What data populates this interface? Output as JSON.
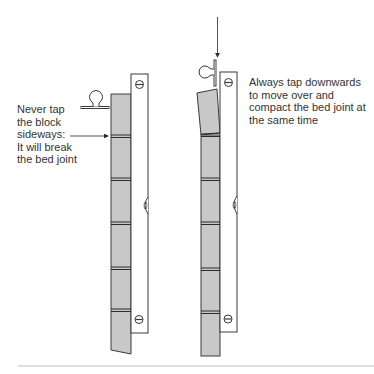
{
  "diagram": {
    "colors": {
      "background": "#ffffff",
      "block_fill": "#c8c8c8",
      "outline": "#3a3a3a",
      "joint": "#2a2a2a",
      "text": "#333333",
      "baseline": "#bdbdbd"
    },
    "left_panel": {
      "caption_lines": [
        "Never tap",
        "the block",
        "sideways:",
        "It will break",
        "the bed joint"
      ],
      "pointer": "arrow-right-to-bed-joint",
      "tool": "trowel-handle-horizontal",
      "level": "spirit-level-vertical"
    },
    "right_panel": {
      "caption_lines": [
        "Always tap downwards",
        "to move over and",
        "compact the bed joint at",
        "the same time"
      ],
      "pointer": "arrow-down-to-trowel",
      "tool": "trowel-handle-vertical",
      "level": "spirit-level-vertical"
    }
  }
}
